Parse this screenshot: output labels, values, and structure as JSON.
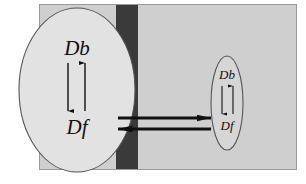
{
  "figure": {
    "type": "diagram",
    "canvas": {
      "width": 306,
      "height": 184,
      "background": "#ffffff"
    },
    "colors": {
      "background": "#ffffff",
      "panel_fill": "#cfcfcf",
      "panel_stroke": "#9a9a9a",
      "band_fill": "#3a3a3a",
      "ellipse_fill_large": "#e2e2e2",
      "ellipse_fill_small": "#d6d6d6",
      "ellipse_stroke": "#555555",
      "arrow_color": "#111111",
      "text_color": "#111111"
    },
    "panel": {
      "name": "outer-panel",
      "x": 39,
      "y": 4,
      "width": 258,
      "height": 166
    },
    "band": {
      "name": "membrane-band",
      "x": 116,
      "y": 4,
      "width": 22,
      "height": 166
    },
    "compartments": [
      {
        "name": "large-compartment",
        "shape": "ellipse",
        "cx": 77,
        "cy": 90,
        "rx": 58,
        "ry": 82,
        "labels": {
          "top": "Db",
          "bottom": "Df"
        },
        "internal_arrows": [
          {
            "name": "down-arrow",
            "direction": "down",
            "from": "Db",
            "to": "Df"
          },
          {
            "name": "up-arrow",
            "direction": "up",
            "from": "Df",
            "to": "Db"
          }
        ]
      },
      {
        "name": "small-compartment",
        "shape": "ellipse",
        "cx": 227,
        "cy": 103,
        "rx": 16,
        "ry": 47,
        "labels": {
          "top": "Db",
          "bottom": "Df"
        },
        "internal_arrows": [
          {
            "name": "down-arrow",
            "direction": "down",
            "from": "Db",
            "to": "Df"
          },
          {
            "name": "up-arrow",
            "direction": "up",
            "from": "Df",
            "to": "Db"
          }
        ]
      }
    ],
    "exchange_arrows": [
      {
        "name": "rightward-transfer-arrow",
        "direction": "right",
        "from": "large-compartment",
        "to": "small-compartment",
        "x1": 118,
        "x2": 211,
        "y": 118
      },
      {
        "name": "leftward-transfer-arrow",
        "direction": "left",
        "from": "small-compartment",
        "to": "large-compartment",
        "x1": 211,
        "x2": 118,
        "y": 129
      }
    ],
    "labels": {
      "bound": "Db",
      "free": "Df"
    }
  }
}
